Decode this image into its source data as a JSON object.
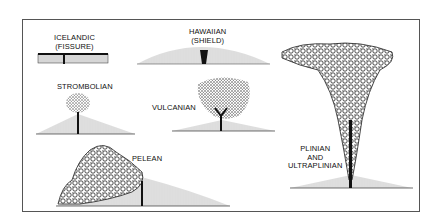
{
  "diagram": {
    "kind": "volcanic eruption types",
    "frame_color": "#555555",
    "ink_color": "#111111",
    "panels": [
      {
        "id": "icelandic",
        "label_lines": [
          "ICELANDIC",
          "(FISSURE)"
        ]
      },
      {
        "id": "hawaiian",
        "label_lines": [
          "HAWAIIAN",
          "(SHIELD)"
        ]
      },
      {
        "id": "strombolian",
        "label_lines": [
          "STROMBOLIAN"
        ]
      },
      {
        "id": "vulcanian",
        "label_lines": [
          "VULCANIAN"
        ]
      },
      {
        "id": "pelean",
        "label_lines": [
          "PELEAN"
        ]
      },
      {
        "id": "plinian",
        "label_lines": [
          "PLINIAN",
          "AND",
          "ULTRAPLINIAN"
        ]
      }
    ]
  },
  "labels": {
    "icelandic": "ICELANDIC\n(FISSURE)",
    "hawaiian": "HAWAIIAN\n(SHIELD)",
    "strombolian": "STROMBOLIAN",
    "vulcanian": "VULCANIAN",
    "pelean": "PELEAN",
    "plinian": "PLINIAN\nAND\nULTRAPLINIAN"
  }
}
